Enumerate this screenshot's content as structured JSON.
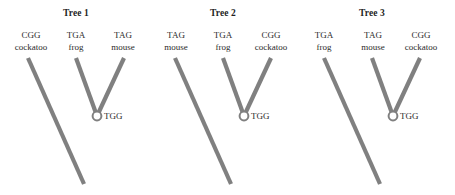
{
  "figure": {
    "background_color": "#ffffff",
    "branch_color": "#808080",
    "node_fill_color": "#ffffff",
    "node_stroke_color": "#808080",
    "text_color": "#2b2b2b"
  },
  "trees": [
    {
      "title": "Tree 1",
      "ancestral_node_label": "TGG",
      "leaves": [
        {
          "codon": "CGG",
          "taxon": "cockatoo"
        },
        {
          "codon": "TGA",
          "taxon": "frog"
        },
        {
          "codon": "TAG",
          "taxon": "mouse"
        }
      ]
    },
    {
      "title": "Tree 2",
      "ancestral_node_label": "TGG",
      "leaves": [
        {
          "codon": "TAG",
          "taxon": "mouse"
        },
        {
          "codon": "TGA",
          "taxon": "frog"
        },
        {
          "codon": "CGG",
          "taxon": "cockatoo"
        }
      ]
    },
    {
      "title": "Tree 3",
      "ancestral_node_label": "TGG",
      "leaves": [
        {
          "codon": "TGA",
          "taxon": "frog"
        },
        {
          "codon": "TAG",
          "taxon": "mouse"
        },
        {
          "codon": "CGG",
          "taxon": "cockatoo"
        }
      ]
    }
  ]
}
